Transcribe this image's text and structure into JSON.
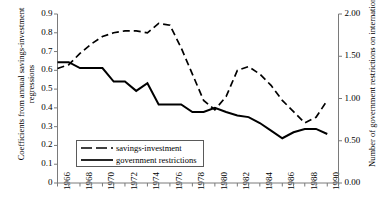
{
  "chart_data": {
    "type": "line",
    "title": "",
    "xlabel": "",
    "ylabel": "Coefficients from annual savings-investment regressions",
    "y2label": "Number of government restrictions on international capital flows",
    "grid": false,
    "legend_position": "inside-lower-left",
    "xlim": [
      1966,
      1991
    ],
    "ylim": [
      0,
      0.9
    ],
    "y2lim": [
      0.0,
      2.0
    ],
    "x": [
      1966,
      1967,
      1968,
      1969,
      1970,
      1971,
      1972,
      1973,
      1974,
      1975,
      1976,
      1977,
      1978,
      1979,
      1980,
      1981,
      1982,
      1983,
      1984,
      1985,
      1986,
      1987,
      1988,
      1989,
      1990
    ],
    "series": [
      {
        "name": "savings-investment",
        "axis": "left",
        "style": "dashed",
        "values": [
          0.61,
          0.63,
          0.69,
          0.74,
          0.78,
          0.8,
          0.81,
          0.81,
          0.8,
          0.85,
          0.84,
          0.72,
          0.58,
          0.44,
          0.39,
          0.46,
          0.6,
          0.62,
          0.58,
          0.52,
          0.44,
          0.38,
          0.32,
          0.35,
          0.44
        ]
      },
      {
        "name": "government restrictions",
        "axis": "right",
        "style": "solid",
        "values": [
          1.43,
          1.43,
          1.36,
          1.36,
          1.36,
          1.2,
          1.2,
          1.09,
          1.18,
          0.93,
          0.93,
          0.93,
          0.84,
          0.84,
          0.89,
          0.84,
          0.8,
          0.78,
          0.71,
          0.62,
          0.53,
          0.6,
          0.64,
          0.64,
          0.58
        ]
      }
    ],
    "yticks": [
      "0",
      "0.1",
      "0.2",
      "0.3",
      "0.4",
      "0.5",
      "0.6",
      "0.7",
      "0.8",
      "0.9"
    ],
    "yticks_values": [
      0,
      0.1,
      0.2,
      0.3,
      0.4,
      0.5,
      0.6,
      0.7,
      0.8,
      0.9
    ],
    "y2ticks": [
      "0.00",
      "0.50",
      "1.00",
      "1.50",
      "2.00"
    ],
    "y2ticks_values": [
      0.0,
      0.5,
      1.0,
      1.5,
      2.0
    ],
    "xticks_major": [
      1966,
      1968,
      1970,
      1972,
      1974,
      1976,
      1978,
      1980,
      1982,
      1984,
      1986,
      1988,
      1990
    ],
    "xticks_labels": [
      "1966",
      "1968",
      "1970",
      "1972",
      "1974",
      "1976",
      "1978",
      "1980",
      "1982",
      "1984",
      "1986",
      "1988",
      "1990"
    ],
    "xticks_minor": [
      1967,
      1969,
      1971,
      1973,
      1975,
      1977,
      1979,
      1981,
      1983,
      1985,
      1987,
      1989,
      1991
    ],
    "colors": {
      "line": "#000000",
      "axis": "#7a7a7a",
      "legend_border": "#5a5a5a",
      "background": "#ffffff"
    }
  },
  "axes": {
    "left_title_line1": "Coefficients from annual savings-investment",
    "left_title_line2": "regressions",
    "right_title": "Number of government restrictions on international capital flows"
  },
  "legend": {
    "items": [
      {
        "label": "savings-investment",
        "style": "dashed"
      },
      {
        "label": "government restrictions",
        "style": "solid"
      }
    ]
  }
}
